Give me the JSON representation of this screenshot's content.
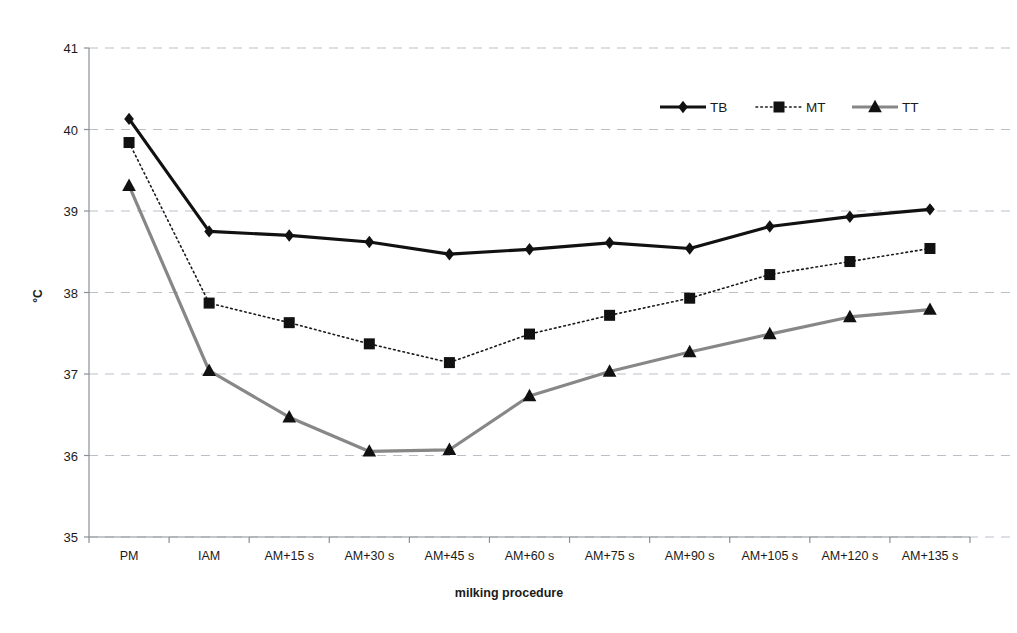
{
  "chart_data": {
    "type": "line",
    "title": "",
    "xlabel": "milking procedure",
    "ylabel": "°C",
    "ylim": [
      35,
      41
    ],
    "yticks": [
      35,
      36,
      37,
      38,
      39,
      40,
      41
    ],
    "ytick_labels": [
      "35",
      "36",
      "37",
      "38",
      "39",
      "40",
      "41"
    ],
    "grid": "horizontal-dashed",
    "legend_position": "top-right-inside",
    "categories": [
      "PM",
      "IAM",
      "AM+15 s",
      "AM+30 s",
      "AM+45 s",
      "AM+60 s",
      "AM+75 s",
      "AM+90 s",
      "AM+105 s",
      "AM+120 s",
      "AM+135 s"
    ],
    "series": [
      {
        "name": "TB",
        "marker": "diamond",
        "line_style": "solid",
        "color": "#111111",
        "marker_color": "#111111",
        "line_width": 3.2,
        "values": [
          40.13,
          38.75,
          38.7,
          38.62,
          38.47,
          38.53,
          38.61,
          38.54,
          38.81,
          38.93,
          39.02
        ]
      },
      {
        "name": "MT",
        "marker": "square",
        "line_style": "dotted",
        "color": "#1a1a1a",
        "marker_color": "#111111",
        "line_width": 1.6,
        "values": [
          39.84,
          37.87,
          37.63,
          37.37,
          37.14,
          37.49,
          37.72,
          37.93,
          38.22,
          38.38,
          38.54
        ]
      },
      {
        "name": "TT",
        "marker": "triangle",
        "line_style": "solid",
        "color": "#878787",
        "marker_color": "#111111",
        "line_width": 3.2,
        "values": [
          39.31,
          37.04,
          36.47,
          36.05,
          36.07,
          36.73,
          37.03,
          37.27,
          37.49,
          37.7,
          37.79
        ]
      }
    ]
  },
  "legend": {
    "items": [
      {
        "label": "TB"
      },
      {
        "label": "MT"
      },
      {
        "label": "TT"
      }
    ]
  },
  "axes": {
    "x_title": "milking procedure",
    "y_title": "°C"
  }
}
